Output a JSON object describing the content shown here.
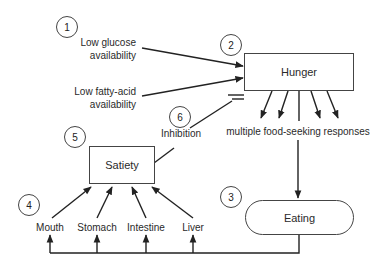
{
  "diagram": {
    "numbers": {
      "n1": "1",
      "n2": "2",
      "n3": "3",
      "n4": "4",
      "n5": "5",
      "n6": "6"
    },
    "inputs": {
      "glucose": [
        "Low glucose",
        "availability"
      ],
      "fatty_acid": [
        "Low fatty-acid",
        "availability"
      ]
    },
    "nodes": {
      "hunger": "Hunger",
      "satiety": "Satiety",
      "eating": "Eating"
    },
    "responses_label": "multiple food-seeking responses",
    "inhibition_label": "Inhibition",
    "organs": [
      "Mouth",
      "Stomach",
      "Intestine",
      "Liver"
    ],
    "colors": {
      "line": "#222222",
      "box_border": "#444444",
      "background": "#ffffff"
    }
  }
}
